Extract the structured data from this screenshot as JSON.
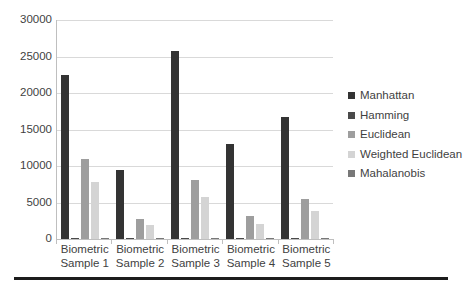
{
  "chart_data": {
    "type": "bar",
    "title": "",
    "xlabel": "",
    "ylabel": "",
    "grid": true,
    "legend_position": "right",
    "ylim": [
      0,
      30000
    ],
    "ytick_step": 5000,
    "yticks": [
      "30000",
      "25000",
      "20000",
      "15000",
      "10000",
      "5000",
      "0"
    ],
    "categories": [
      {
        "line1": "Biometric",
        "line2": "Sample 1"
      },
      {
        "line1": "Biometric",
        "line2": "Sample 2"
      },
      {
        "line1": "Biometric",
        "line2": "Sample 3"
      },
      {
        "line1": "Biometric",
        "line2": "Sample 4"
      },
      {
        "line1": "Biometric",
        "line2": "Sample 5"
      }
    ],
    "series": [
      {
        "name": "Manhattan",
        "color": "#333333",
        "values": [
          22450,
          9400,
          25750,
          13050,
          16650
        ]
      },
      {
        "name": "Hamming",
        "color": "#4a4a4a",
        "values": [
          120,
          110,
          130,
          100,
          115
        ]
      },
      {
        "name": "Euclidean",
        "color": "#9e9e9e",
        "values": [
          11000,
          2800,
          8150,
          3100,
          5550
        ]
      },
      {
        "name": "Weighted Euclidean",
        "color": "#d4d4d4",
        "values": [
          7800,
          1900,
          5750,
          2100,
          3800
        ]
      },
      {
        "name": "Mahalanobis",
        "color": "#787878",
        "values": [
          90,
          80,
          95,
          75,
          85
        ]
      }
    ]
  }
}
